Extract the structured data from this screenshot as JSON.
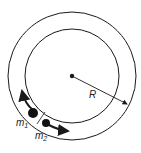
{
  "diagram": {
    "labels": {
      "radius": "R",
      "mass1": "m",
      "mass1_sub": "1",
      "mass2": "m",
      "mass2_sub": "2"
    },
    "colors": {
      "stroke": "#1a1a1a",
      "background": "#ffffff"
    }
  }
}
